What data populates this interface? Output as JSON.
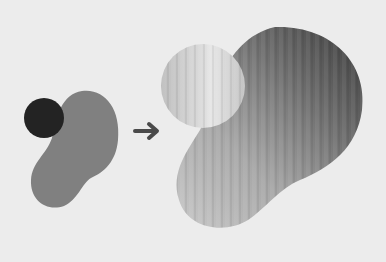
{
  "diagram": {
    "type": "before-after transformation",
    "background": "#ececec",
    "before": {
      "circle": {
        "color": "#232323",
        "cx": 44,
        "cy": 118,
        "r": 20
      },
      "blob": {
        "color": "#808080"
      }
    },
    "arrow": {
      "direction": "right",
      "color": "#4a4a4a"
    },
    "after": {
      "circle": {
        "fill": "light metallic gradient",
        "cx": 203,
        "cy": 86,
        "r": 42
      },
      "blob": {
        "fill": "metallic gradient, light bottom-left to dark top-right"
      }
    }
  }
}
